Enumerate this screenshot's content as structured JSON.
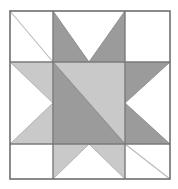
{
  "figure": {
    "name": "Sawtooth Star quilt block diagram",
    "title": "",
    "canvas": {
      "width": 178,
      "height": 189
    },
    "background_color": "#ffffff"
  },
  "palette": {
    "background": "#ffffff",
    "light_gray": "#c9c9c9",
    "dark_gray": "#9b9b9b",
    "grid_line": "#7a7a7a",
    "border_line": "#6e6e6e",
    "faint_diagonal": "#b9b9b9"
  },
  "block": {
    "frame": {
      "x": 10,
      "y": 11,
      "width": 160,
      "height": 168
    },
    "grid": {
      "columns": 3,
      "rows": 3,
      "vertical_lines_x": [
        53,
        125
      ],
      "horizontal_lines_y": [
        62,
        144
      ]
    },
    "cells": [
      {
        "position": "top-left",
        "fill": "background",
        "motif": "plain-square-with-diagonal"
      },
      {
        "position": "top-center",
        "fill": "dark_gray",
        "motif": "flying-geese-down"
      },
      {
        "position": "top-right",
        "fill": "background",
        "motif": "plain-square"
      },
      {
        "position": "middle-left",
        "fill": "light_gray",
        "motif": "flying-geese-right"
      },
      {
        "position": "center",
        "fill": "dark_gray",
        "motif": "half-square-triangle"
      },
      {
        "position": "middle-right",
        "fill": "dark_gray",
        "motif": "flying-geese-left"
      },
      {
        "position": "bottom-left",
        "fill": "background",
        "motif": "plain-square"
      },
      {
        "position": "bottom-center",
        "fill": "light_gray",
        "motif": "flying-geese-up"
      },
      {
        "position": "bottom-right",
        "fill": "background",
        "motif": "plain-square-with-diagonal"
      }
    ]
  },
  "chart_data": {
    "type": "diagram",
    "shapes": [
      {
        "name": "outer-frame",
        "type": "rect",
        "points": "10,11 170,11 170,179 10,179",
        "fill": "none",
        "stroke": "#6e6e6e"
      },
      {
        "name": "top-left-square",
        "type": "polygon",
        "points": "10,11 53,11 53,62 10,62",
        "fill": "#ffffff"
      },
      {
        "name": "top-left-diagonal",
        "type": "line",
        "points": "10,11 53,62",
        "stroke": "#b9b9b9"
      },
      {
        "name": "top-center-left-triangle",
        "type": "polygon",
        "points": "53,11 53,62 89,62",
        "fill": "#9b9b9b"
      },
      {
        "name": "top-center-right-triangle",
        "type": "polygon",
        "points": "125,11 125,62 89,62",
        "fill": "#9b9b9b"
      },
      {
        "name": "top-right-square",
        "type": "polygon",
        "points": "125,11 170,11 170,62 125,62",
        "fill": "#ffffff"
      },
      {
        "name": "middle-left-upper-triangle",
        "type": "polygon",
        "points": "10,62 53,62 53,103",
        "fill": "#c9c9c9"
      },
      {
        "name": "middle-left-lower-triangle",
        "type": "polygon",
        "points": "10,144 53,144 53,103",
        "fill": "#c9c9c9"
      },
      {
        "name": "center-lower-left-triangle",
        "type": "polygon",
        "points": "53,62 53,144 125,144",
        "fill": "#9b9b9b"
      },
      {
        "name": "center-upper-right-triangle",
        "type": "polygon",
        "points": "53,62 125,62 125,144",
        "fill": "#c9c9c9"
      },
      {
        "name": "middle-right-upper-triangle",
        "type": "polygon",
        "points": "125,62 170,62 125,103",
        "fill": "#9b9b9b"
      },
      {
        "name": "middle-right-lower-triangle",
        "type": "polygon",
        "points": "125,144 170,144 125,103",
        "fill": "#9b9b9b"
      },
      {
        "name": "bottom-left-square",
        "type": "polygon",
        "points": "10,144 53,144 53,179 10,179",
        "fill": "#ffffff"
      },
      {
        "name": "bottom-center-left-triangle",
        "type": "polygon",
        "points": "53,144 53,179 89,144",
        "fill": "#c9c9c9"
      },
      {
        "name": "bottom-center-right-triangle",
        "type": "polygon",
        "points": "125,144 125,179 89,144",
        "fill": "#c9c9c9"
      },
      {
        "name": "bottom-right-square",
        "type": "polygon",
        "points": "125,144 170,144 170,179 125,179",
        "fill": "#ffffff"
      },
      {
        "name": "bottom-right-diagonal",
        "type": "line",
        "points": "125,144 170,179",
        "stroke": "#b9b9b9"
      },
      {
        "name": "grid-vertical-left",
        "type": "line",
        "points": "53,11 53,179",
        "stroke": "#7a7a7a"
      },
      {
        "name": "grid-vertical-right",
        "type": "line",
        "points": "125,11 125,179",
        "stroke": "#7a7a7a"
      },
      {
        "name": "grid-horizontal-top",
        "type": "line",
        "points": "10,62 170,62",
        "stroke": "#7a7a7a"
      },
      {
        "name": "grid-horizontal-bottom",
        "type": "line",
        "points": "10,144 170,144",
        "stroke": "#7a7a7a"
      }
    ]
  }
}
